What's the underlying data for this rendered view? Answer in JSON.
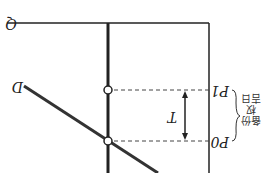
{
  "diagram": {
    "orientation": "rotated 180 degrees",
    "axis_label": "Q",
    "curve_label": "D",
    "tax_label": "T",
    "price_high_label": "P1",
    "price_low_label": "P0",
    "bracket_text_line1": "备份权",
    "bracket_text_line2": "吉日"
  }
}
